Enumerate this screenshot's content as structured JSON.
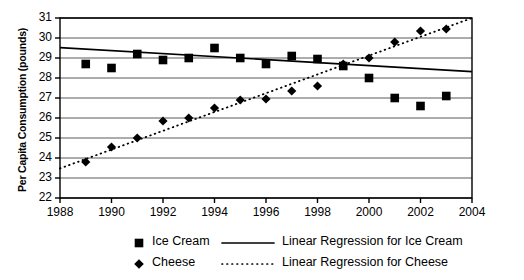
{
  "chart_data": {
    "type": "scatter",
    "title": "",
    "xlabel": "",
    "ylabel": "Per Capita Consumption (pounds)",
    "xlim": [
      1988,
      2004
    ],
    "ylim": [
      22,
      31
    ],
    "grid": true,
    "x_ticks": [
      "1988",
      "1990",
      "1992",
      "1994",
      "1996",
      "1998",
      "2000",
      "2002",
      "2004"
    ],
    "x_tick_values": [
      1988,
      1990,
      1992,
      1994,
      1996,
      1998,
      2000,
      2002,
      2004
    ],
    "y_ticks": [
      "22",
      "23",
      "24",
      "25",
      "26",
      "27",
      "28",
      "29",
      "30",
      "31"
    ],
    "y_tick_values": [
      22,
      23,
      24,
      25,
      26,
      27,
      28,
      29,
      30,
      31
    ],
    "legend_position": "bottom",
    "series": [
      {
        "name": "Ice Cream",
        "marker": "square",
        "color": "#000000",
        "x": [
          1989,
          1990,
          1991,
          1992,
          1993,
          1994,
          1995,
          1996,
          1997,
          1998,
          1999,
          2000,
          2001,
          2002,
          2003
        ],
        "values": [
          28.7,
          28.5,
          29.2,
          28.9,
          29.0,
          29.5,
          29.0,
          28.7,
          29.1,
          28.95,
          28.6,
          28.0,
          27.0,
          26.6,
          27.1
        ]
      },
      {
        "name": "Cheese",
        "marker": "diamond",
        "color": "#000000",
        "x": [
          1989,
          1990,
          1991,
          1992,
          1993,
          1994,
          1995,
          1996,
          1997,
          1998,
          1999,
          2000,
          2001,
          2002,
          2003
        ],
        "values": [
          23.8,
          24.55,
          25.0,
          25.85,
          26.0,
          26.5,
          26.9,
          26.95,
          27.35,
          27.6,
          28.7,
          29.0,
          29.8,
          30.35,
          30.45
        ]
      },
      {
        "name": "Linear Regression for Ice Cream",
        "marker": "line-solid",
        "color": "#000000",
        "x": [
          1988,
          2004
        ],
        "values": [
          29.52,
          28.32
        ]
      },
      {
        "name": "Linear Regression for Cheese",
        "marker": "line-dotted",
        "color": "#000000",
        "x": [
          1988,
          2004
        ],
        "values": [
          23.48,
          31.0
        ]
      }
    ]
  },
  "legend": {
    "items": [
      {
        "label": "Ice Cream",
        "marker": "square"
      },
      {
        "label": "Cheese",
        "marker": "diamond"
      },
      {
        "label": "Linear Regression for Ice Cream",
        "marker": "line-solid"
      },
      {
        "label": "Linear Regression for Cheese",
        "marker": "line-dotted"
      }
    ]
  },
  "colors": {
    "ink": "#000000",
    "grid": "#5a5a5a",
    "axis": "#000000",
    "background": "#ffffff"
  }
}
